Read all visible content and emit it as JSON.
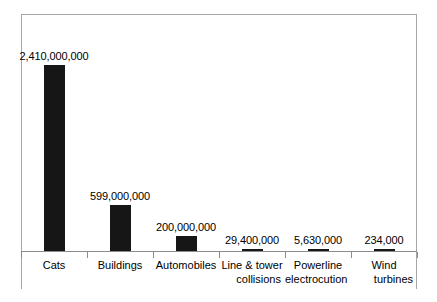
{
  "chart_data": {
    "type": "bar",
    "title": "",
    "subtitle": "",
    "xlabel": "",
    "ylabel": "",
    "grid": false,
    "legend": "none",
    "axis": {
      "y_visible": false,
      "x_visible": true,
      "ylim": [
        0,
        2410000000
      ],
      "ticks_between_categories": true
    },
    "categories": [
      "Cats",
      "Buildings",
      "Automobiles",
      "Line & tower collisions",
      "Powerline electrocution",
      "Wind turbines"
    ],
    "category_lines": [
      [
        "Cats",
        ""
      ],
      [
        "Buildings",
        ""
      ],
      [
        "Automobiles",
        ""
      ],
      [
        "Line & tower",
        "collisions"
      ],
      [
        "Powerline",
        "electrocution"
      ],
      [
        "Wind",
        "turbines"
      ]
    ],
    "values": [
      2410000000,
      599000000,
      200000000,
      29400000,
      5630000,
      234000
    ],
    "data_labels": [
      "2,410,000,000",
      "599,000,000",
      "200,000,000",
      "29,400,000",
      "5,630,000",
      "234,000"
    ],
    "colors": {
      "bar": "#161616",
      "frame": "#a6a6a6",
      "axis": "#8c8c8c",
      "text": "#000000",
      "background": "#ffffff"
    }
  }
}
